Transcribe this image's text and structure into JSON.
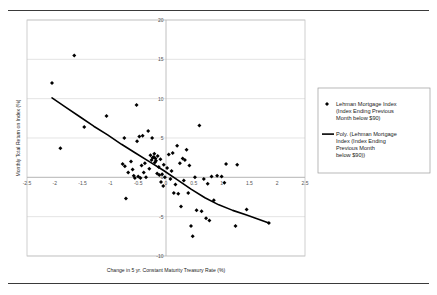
{
  "figure": {
    "rule_color": "#3a3a3a"
  },
  "legend": {
    "box_border_color": "#9a9a9a",
    "entries": [
      {
        "marker": "diamond-marker",
        "lines": [
          "Lehman Mortgage Index",
          "(Index Ending Previous",
          "Month below $90)"
        ]
      },
      {
        "marker": "line-marker",
        "lines": [
          "Poly. (Lehman Mortgage",
          "Index (Index Ending",
          "Previous Month",
          "below $90))"
        ]
      }
    ]
  },
  "chart_data": {
    "type": "scatter",
    "title": "",
    "xlabel": "Change in 5 yr. Constant Maturity Treasury Rate (%)",
    "ylabel": "Monthly Total Return on Index (%)",
    "xlim": [
      -2.5,
      2.5
    ],
    "ylim": [
      -10,
      20
    ],
    "xticks": [
      -2.5,
      -2,
      -1.5,
      -1,
      -0.5,
      0,
      0.5,
      1,
      1.5,
      2,
      2.5
    ],
    "xtick_labels": [
      "-2.5",
      "-2",
      "-1.5",
      "-1",
      "-0.5",
      "0",
      "0.5",
      "1",
      "1.5",
      "2",
      "2.5"
    ],
    "yticks": [
      -10,
      -5,
      0,
      5,
      10,
      15,
      20
    ],
    "ytick_labels": [
      "-10",
      "-5",
      "0",
      "5",
      "10",
      "15",
      "20"
    ],
    "grid": "horizontal",
    "grid_color": "#d9d9d9",
    "axis_color": "#b0b0b0",
    "marker_color": "#000000",
    "marker_size": 2.0,
    "trendline_color": "#000000",
    "trendline_width": 1.6,
    "legend_position": "right",
    "series": [
      {
        "name": "Lehman Mortgage Index (Index Ending Previous Month below $90)",
        "points": [
          [
            -2.05,
            12.0
          ],
          [
            -1.9,
            3.7
          ],
          [
            -1.65,
            15.5
          ],
          [
            -1.47,
            6.4
          ],
          [
            -1.07,
            7.8
          ],
          [
            -0.78,
            1.7
          ],
          [
            -0.75,
            5.0
          ],
          [
            -0.74,
            1.4
          ],
          [
            -0.72,
            -2.7
          ],
          [
            -0.68,
            0.6
          ],
          [
            -0.63,
            2.0
          ],
          [
            -0.6,
            1.0
          ],
          [
            -0.58,
            0.2
          ],
          [
            -0.56,
            -0.1
          ],
          [
            -0.53,
            9.2
          ],
          [
            -0.52,
            4.6
          ],
          [
            -0.5,
            0.1
          ],
          [
            -0.48,
            5.2
          ],
          [
            -0.46,
            -0.1
          ],
          [
            -0.44,
            1.5
          ],
          [
            -0.42,
            5.3
          ],
          [
            -0.4,
            0.6
          ],
          [
            -0.38,
            1.8
          ],
          [
            -0.36,
            0.0
          ],
          [
            -0.32,
            5.9
          ],
          [
            -0.3,
            1.1
          ],
          [
            -0.28,
            2.8
          ],
          [
            -0.26,
            2.2
          ],
          [
            -0.25,
            5.0
          ],
          [
            -0.24,
            2.5
          ],
          [
            -0.22,
            2.6
          ],
          [
            -0.21,
            3.0
          ],
          [
            -0.2,
            1.9
          ],
          [
            -0.19,
            2.4
          ],
          [
            -0.18,
            2.1
          ],
          [
            -0.16,
            0.5
          ],
          [
            -0.15,
            2.7
          ],
          [
            -0.13,
            1.3
          ],
          [
            -0.12,
            0.3
          ],
          [
            -0.1,
            2.3
          ],
          [
            -0.09,
            -0.6
          ],
          [
            -0.07,
            0.4
          ],
          [
            -0.05,
            -1.1
          ],
          [
            -0.04,
            1.6
          ],
          [
            -0.02,
            0.0
          ],
          [
            0.02,
            1.2
          ],
          [
            0.05,
            2.9
          ],
          [
            0.08,
            -0.2
          ],
          [
            0.1,
            0.8
          ],
          [
            0.12,
            3.1
          ],
          [
            0.14,
            -2.0
          ],
          [
            0.17,
            -0.9
          ],
          [
            0.2,
            4.0
          ],
          [
            0.22,
            -2.1
          ],
          [
            0.25,
            1.8
          ],
          [
            0.27,
            -3.7
          ],
          [
            0.3,
            2.4
          ],
          [
            0.32,
            -0.4
          ],
          [
            0.34,
            2.2
          ],
          [
            0.37,
            3.5
          ],
          [
            0.4,
            -2.0
          ],
          [
            0.42,
            1.5
          ],
          [
            0.45,
            -6.2
          ],
          [
            0.48,
            -7.5
          ],
          [
            0.52,
            0.0
          ],
          [
            0.55,
            -4.2
          ],
          [
            0.6,
            6.6
          ],
          [
            0.64,
            -4.3
          ],
          [
            0.68,
            -0.2
          ],
          [
            0.72,
            -5.2
          ],
          [
            0.75,
            -0.8
          ],
          [
            0.78,
            -5.5
          ],
          [
            0.82,
            0.1
          ],
          [
            0.86,
            -2.9
          ],
          [
            0.92,
            0.2
          ],
          [
            1.0,
            0.1
          ],
          [
            1.05,
            -0.7
          ],
          [
            1.08,
            1.7
          ],
          [
            1.25,
            -6.2
          ],
          [
            1.28,
            1.6
          ],
          [
            1.45,
            -4.1
          ],
          [
            1.85,
            -5.8
          ]
        ]
      }
    ],
    "trendline": {
      "name": "Poly. (Lehman Mortgage Index (Index Ending Previous Month below $90))",
      "points": [
        [
          -2.05,
          10.1
        ],
        [
          -1.8,
          8.9
        ],
        [
          -1.55,
          7.7
        ],
        [
          -1.3,
          6.5
        ],
        [
          -1.05,
          5.4
        ],
        [
          -0.8,
          4.2
        ],
        [
          -0.55,
          3.1
        ],
        [
          -0.3,
          2.0
        ],
        [
          -0.05,
          0.9
        ],
        [
          0.2,
          -0.3
        ],
        [
          0.45,
          -1.5
        ],
        [
          0.7,
          -2.6
        ],
        [
          0.95,
          -3.5
        ],
        [
          1.2,
          -4.2
        ],
        [
          1.45,
          -4.8
        ],
        [
          1.65,
          -5.3
        ],
        [
          1.85,
          -5.8
        ]
      ]
    }
  }
}
